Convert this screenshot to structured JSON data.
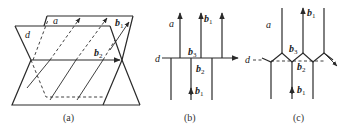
{
  "figure": {
    "panels": [
      {
        "id": "a",
        "caption": "(a)",
        "labels": {
          "plane_a": "a",
          "line_d": "d",
          "vector_b1": "b",
          "vector_b1_sub": "1",
          "vector_b2": "b",
          "vector_b2_sub": "2"
        }
      },
      {
        "id": "b",
        "caption": "(b)",
        "labels": {
          "a": "a",
          "d": "d",
          "b1_top": "b",
          "b1_top_sub": "1",
          "b3": "b",
          "b3_sub": "3",
          "b2": "b",
          "b2_sub": "2",
          "b1_bottom": "b",
          "b1_bottom_sub": "1"
        }
      },
      {
        "id": "c",
        "caption": "(c)",
        "labels": {
          "a": "a",
          "d": "d",
          "b1_top": "b",
          "b1_top_sub": "1",
          "b3": "b",
          "b3_sub": "3",
          "b2": "b",
          "b2_sub": "2",
          "b1_bottom": "b",
          "b1_bottom_sub": "1"
        }
      }
    ],
    "colors": {
      "line": "#2a2a2a",
      "background": "#ffffff"
    }
  }
}
